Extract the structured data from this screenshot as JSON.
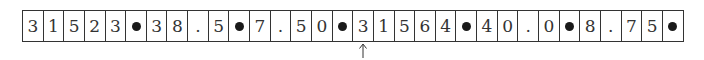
{
  "tape": {
    "cells": [
      "3",
      "1",
      "5",
      "2",
      "3",
      "•",
      "3",
      "8",
      ".",
      "5",
      "•",
      "7",
      ".",
      "5",
      "0",
      "•",
      "3",
      "1",
      "5",
      "6",
      "4",
      "•",
      "4",
      "0",
      ".",
      "0",
      "•",
      "8",
      ".",
      "7",
      "5",
      "•"
    ],
    "separator": "•",
    "pointer_index": 16
  },
  "records": [
    {
      "id": "31523",
      "value_a": "38.5",
      "value_b": "7.50"
    },
    {
      "id": "31564",
      "value_a": "40.0",
      "value_b": "8.75"
    }
  ],
  "pointer": {
    "icon": "up-arrow-icon"
  }
}
